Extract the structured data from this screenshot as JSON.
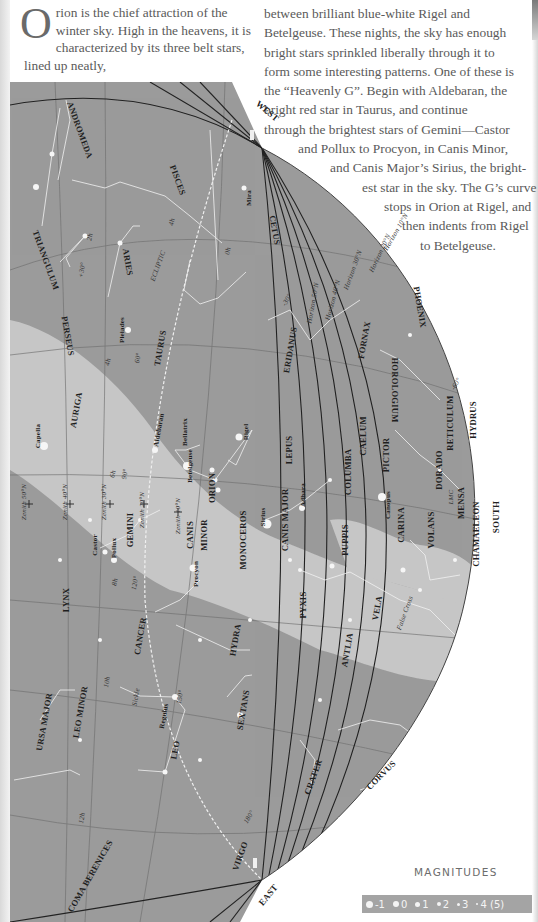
{
  "text": {
    "intro_dropcap": "O",
    "intro_rest": "rion is the chief attraction of the winter sky. High in the heavens, it is characterized by its three belt stars, lined up neatly,",
    "right_lines": [
      "between brilliant blue-white Rigel and",
      "Betelgeuse. These nights, the sky has enough",
      "bright stars sprinkled liberally through it to",
      "form some interesting patterns. One of these is",
      "the “Heavenly G”. Begin with Aldebaran, the",
      "bright red star in Taurus, and continue",
      "through the brightest stars of Gemini—Castor",
      "and Pollux to Procyon, in Canis Minor,",
      "and Canis Major’s Sirius, the bright-",
      "est star in the sky. The G’s curve",
      "stops in Orion at Rigel, and",
      "then indents from Rigel",
      "to Betelgeuse."
    ]
  },
  "colors": {
    "sky": "#9a9a9a",
    "milky_way": "#c4c4c4",
    "lines": "#f0f0f0",
    "horizon": "#2a2a2a",
    "text": "#5a5a5a"
  },
  "map": {
    "directions": {
      "west": "WEST",
      "east": "EAST",
      "south": "SOUTH"
    },
    "constellations": [
      {
        "name": "ANDROMEDA",
        "x": 80,
        "y": 130,
        "r": 70
      },
      {
        "name": "PISCES",
        "x": 178,
        "y": 180,
        "r": 70
      },
      {
        "name": "TRIANGULUM",
        "x": 46,
        "y": 260,
        "r": 70
      },
      {
        "name": "ARIES",
        "x": 128,
        "y": 262,
        "r": 80
      },
      {
        "name": "PERSEUS",
        "x": 68,
        "y": 336,
        "r": 80
      },
      {
        "name": "TAURUS",
        "x": 160,
        "y": 348,
        "r": -80
      },
      {
        "name": "AURIGA",
        "x": 76,
        "y": 410,
        "r": -80
      },
      {
        "name": "CETUS",
        "x": 275,
        "y": 230,
        "r": 80
      },
      {
        "name": "ERIDANUS",
        "x": 290,
        "y": 350,
        "r": -80
      },
      {
        "name": "FORNAX",
        "x": 364,
        "y": 340,
        "r": -80
      },
      {
        "name": "PHOENIX",
        "x": 420,
        "y": 307,
        "r": 80
      },
      {
        "name": "HOROLOGIUM",
        "x": 395,
        "y": 390,
        "r": 90
      },
      {
        "name": "RETICULUM",
        "x": 450,
        "y": 423,
        "r": -90
      },
      {
        "name": "HYDRUS",
        "x": 473,
        "y": 420,
        "r": -90
      },
      {
        "name": "LEPUS",
        "x": 289,
        "y": 450,
        "r": -90
      },
      {
        "name": "COLUMBA",
        "x": 348,
        "y": 472,
        "r": -90
      },
      {
        "name": "CAELUM",
        "x": 363,
        "y": 436,
        "r": -90
      },
      {
        "name": "PICTOR",
        "x": 386,
        "y": 455,
        "r": -90
      },
      {
        "name": "DORADO",
        "x": 439,
        "y": 470,
        "r": -90
      },
      {
        "name": "MENSA",
        "x": 461,
        "y": 503,
        "r": -90
      },
      {
        "name": "ORION",
        "x": 212,
        "y": 488,
        "r": -90
      },
      {
        "name": "MONOCEROS",
        "x": 243,
        "y": 540,
        "r": -90
      },
      {
        "name": "CANIS MAJOR",
        "x": 285,
        "y": 520,
        "r": -90
      },
      {
        "name": "PUPPIS",
        "x": 345,
        "y": 540,
        "r": -90
      },
      {
        "name": "CARINA",
        "x": 401,
        "y": 525,
        "r": -90
      },
      {
        "name": "VOLANS",
        "x": 431,
        "y": 530,
        "r": -90
      },
      {
        "name": "CHAMAELEON",
        "x": 476,
        "y": 534,
        "r": -90
      },
      {
        "name": "GEMINI",
        "x": 130,
        "y": 530,
        "r": -90
      },
      {
        "name": "CANIS",
        "x": 190,
        "y": 535,
        "r": -90
      },
      {
        "name": "MINOR",
        "x": 204,
        "y": 535,
        "r": -90
      },
      {
        "name": "LYNX",
        "x": 66,
        "y": 600,
        "r": -90
      },
      {
        "name": "CANCER",
        "x": 140,
        "y": 636,
        "r": -80
      },
      {
        "name": "HYDRA",
        "x": 235,
        "y": 640,
        "r": -80
      },
      {
        "name": "PYXIS",
        "x": 303,
        "y": 605,
        "r": -90
      },
      {
        "name": "ANTLIA",
        "x": 347,
        "y": 650,
        "r": -80
      },
      {
        "name": "VELA",
        "x": 377,
        "y": 608,
        "r": -80
      },
      {
        "name": "URSA MAJOR",
        "x": 44,
        "y": 722,
        "r": -80
      },
      {
        "name": "LEO MINOR",
        "x": 80,
        "y": 712,
        "r": -80
      },
      {
        "name": "SEXTANS",
        "x": 243,
        "y": 710,
        "r": -80
      },
      {
        "name": "LEO",
        "x": 175,
        "y": 750,
        "r": -80
      },
      {
        "name": "CRATER",
        "x": 313,
        "y": 777,
        "r": -70
      },
      {
        "name": "CORVUS",
        "x": 381,
        "y": 775,
        "r": -45
      },
      {
        "name": "VIRGO",
        "x": 240,
        "y": 856,
        "r": -70
      },
      {
        "name": "COMA BERENICES",
        "x": 90,
        "y": 876,
        "r": -60
      }
    ],
    "stars": [
      {
        "name": "Capella",
        "x": 38,
        "y": 436,
        "r": -90
      },
      {
        "name": "Pleiades",
        "x": 122,
        "y": 330,
        "r": -90
      },
      {
        "name": "Aldebaran",
        "x": 159,
        "y": 430,
        "r": -80
      },
      {
        "name": "Bellatrix",
        "x": 185,
        "y": 432,
        "r": -90
      },
      {
        "name": "Betelgeuse",
        "x": 190,
        "y": 466,
        "r": -90
      },
      {
        "name": "Rigel",
        "x": 246,
        "y": 432,
        "r": -90
      },
      {
        "name": "Sirius",
        "x": 263,
        "y": 517,
        "r": -90
      },
      {
        "name": "Adhara",
        "x": 303,
        "y": 495,
        "r": -90
      },
      {
        "name": "Canopus",
        "x": 388,
        "y": 505,
        "r": -90
      },
      {
        "name": "Castor",
        "x": 95,
        "y": 545,
        "r": -90
      },
      {
        "name": "Pollux",
        "x": 114,
        "y": 548,
        "r": -90
      },
      {
        "name": "Procyon",
        "x": 196,
        "y": 574,
        "r": -90
      },
      {
        "name": "Regulus",
        "x": 164,
        "y": 716,
        "r": -80
      },
      {
        "name": "Mira",
        "x": 249,
        "y": 198,
        "r": -90
      }
    ],
    "annotations": [
      {
        "text": "ECLIPTIC",
        "x": 158,
        "y": 266,
        "r": -70
      },
      {
        "text": "Sickle",
        "x": 136,
        "y": 697,
        "r": -80
      },
      {
        "text": "False Cross",
        "x": 405,
        "y": 613,
        "r": -70
      },
      {
        "text": "LMC",
        "x": 451,
        "y": 497,
        "r": -90
      },
      {
        "text": "Zenith 50°N",
        "x": 24,
        "y": 502,
        "r": -90
      },
      {
        "text": "Zenith 40°N",
        "x": 65,
        "y": 502,
        "r": -90
      },
      {
        "text": "Zenith 30°N",
        "x": 104,
        "y": 502,
        "r": -90
      },
      {
        "text": "Zenith 20°N",
        "x": 142,
        "y": 510,
        "r": -90
      },
      {
        "text": "Zenith 10°N",
        "x": 178,
        "y": 516,
        "r": -90
      },
      {
        "text": "Horizon 50°N",
        "x": 313,
        "y": 303,
        "r": -80
      },
      {
        "text": "Horizon 40°N",
        "x": 333,
        "y": 300,
        "r": -75
      },
      {
        "text": "Horizon 30°N",
        "x": 353,
        "y": 270,
        "r": -70
      },
      {
        "text": "Horizon 20°N",
        "x": 380,
        "y": 253,
        "r": -65
      },
      {
        "text": "Horizon 10°N",
        "x": 396,
        "y": 232,
        "r": -60
      },
      {
        "text": "+30°",
        "x": 82,
        "y": 270,
        "r": -80
      },
      {
        "text": "2h",
        "x": 90,
        "y": 237,
        "r": -80
      },
      {
        "text": "4h",
        "x": 172,
        "y": 222,
        "r": -80
      },
      {
        "text": "0h",
        "x": 228,
        "y": 251,
        "r": -80
      },
      {
        "text": "4h",
        "x": 108,
        "y": 362,
        "r": -80
      },
      {
        "text": "60°",
        "x": 138,
        "y": 358,
        "r": -80
      },
      {
        "text": "6h",
        "x": 113,
        "y": 474,
        "r": -80
      },
      {
        "text": "90°",
        "x": 125,
        "y": 474,
        "r": -80
      },
      {
        "text": "8h",
        "x": 115,
        "y": 582,
        "r": -80
      },
      {
        "text": "120°",
        "x": 135,
        "y": 583,
        "r": -80
      },
      {
        "text": "10h",
        "x": 107,
        "y": 682,
        "r": -80
      },
      {
        "text": "150°",
        "x": 180,
        "y": 697,
        "r": -80
      },
      {
        "text": "12h",
        "x": 82,
        "y": 818,
        "r": -80
      },
      {
        "text": "180°",
        "x": 249,
        "y": 817,
        "r": -60
      },
      {
        "text": "-30°",
        "x": 287,
        "y": 300,
        "r": -60
      },
      {
        "text": "-60°",
        "x": 456,
        "y": 384,
        "r": -60
      }
    ]
  },
  "legend": {
    "title": "MAGNITUDES",
    "items": [
      {
        "label": "-1",
        "size": 7
      },
      {
        "label": "0",
        "size": 6
      },
      {
        "label": "1",
        "size": 5
      },
      {
        "label": "2",
        "size": 4
      },
      {
        "label": "3",
        "size": 3
      },
      {
        "label": "4 (5)",
        "size": 2
      }
    ]
  }
}
